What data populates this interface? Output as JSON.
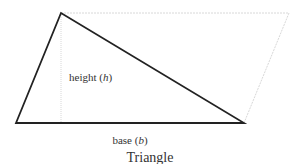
{
  "diagram": {
    "title": "Triangle",
    "height_label": "height (h)",
    "height_label_prefix": "height (",
    "height_label_var": "h",
    "height_label_suffix": ")",
    "base_label_prefix": "base (",
    "base_label_var": "b",
    "base_label_suffix": ")",
    "colors": {
      "triangle_stroke": "#222222",
      "guide_stroke": "#d8d8d8",
      "text": "#333333"
    },
    "points": {
      "apex": [
        61,
        13
      ],
      "bottom_left": [
        16,
        123
      ],
      "bottom_right": [
        244,
        123
      ],
      "parallelogram_top_right": [
        289,
        13
      ]
    }
  }
}
